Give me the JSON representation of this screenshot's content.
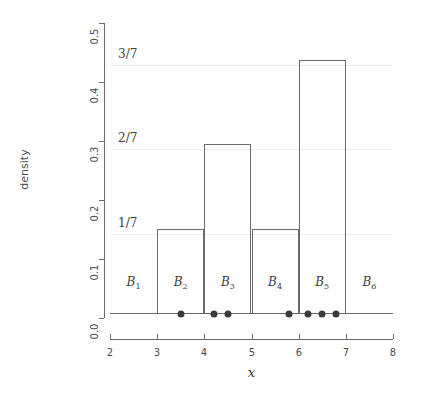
{
  "chart_data": {
    "type": "bar",
    "title": "",
    "xlabel": "x",
    "ylabel": "density",
    "xlim": [
      2,
      8
    ],
    "ylim": [
      0.0,
      0.5
    ],
    "grid": true,
    "legend": "none",
    "bin_edges": [
      2,
      3,
      4,
      5,
      6,
      7,
      8
    ],
    "categories": [
      "B1",
      "B2",
      "B3",
      "B4",
      "B5",
      "B6"
    ],
    "bin_labels": [
      "B",
      "B",
      "B",
      "B",
      "B",
      "B"
    ],
    "bin_label_subscripts": [
      "1",
      "2",
      "3",
      "4",
      "5",
      "6"
    ],
    "values": [
      0.0,
      0.142857,
      0.285714,
      0.142857,
      0.428571,
      0.0
    ],
    "value_labels": [
      "0",
      "1/7",
      "2/7",
      "1/7",
      "3/7",
      "0"
    ],
    "counts": [
      0,
      1,
      2,
      1,
      3,
      0
    ],
    "x_ticks": [
      2,
      3,
      4,
      5,
      6,
      7,
      8
    ],
    "x_tick_labels": [
      "2",
      "3",
      "4",
      "5",
      "6",
      "7",
      "8"
    ],
    "y_ticks": [
      0.0,
      0.1,
      0.2,
      0.3,
      0.4,
      0.5
    ],
    "y_tick_labels": [
      "0.0",
      "0.1",
      "0.2",
      "0.3",
      "0.4",
      "0.5"
    ],
    "fraction_annotations": [
      {
        "label": "1/7",
        "value": 0.142857
      },
      {
        "label": "2/7",
        "value": 0.285714
      },
      {
        "label": "3/7",
        "value": 0.428571
      }
    ],
    "rug_points": [
      3.5,
      4.2,
      4.5,
      5.8,
      6.2,
      6.5,
      6.8
    ],
    "colors": {
      "axis": "#6b6b6b",
      "bar_outline": "#6b6b6b",
      "gridline": "#ededed",
      "point": "#3a3a3a",
      "text": "#3d3d3d",
      "background": "#ffffff"
    }
  }
}
